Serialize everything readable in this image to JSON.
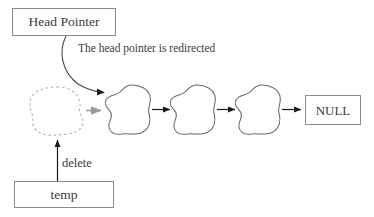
{
  "diagram": {
    "canvas": {
      "width": 374,
      "height": 217,
      "background": "#ffffff"
    },
    "colors": {
      "stroke": "#5a5a5a",
      "box_border": "#8a8a8a",
      "text": "#3a3a3a",
      "dashed_node": "#b0b0b0",
      "gray_arrow": "#9a9a9a",
      "black_arrow": "#1a1a1a"
    },
    "boxes": [
      {
        "id": "head-pointer",
        "label": "Head Pointer",
        "x": 12,
        "y": 8,
        "width": 104,
        "height": 28
      },
      {
        "id": "null",
        "label": "NULL",
        "x": 305,
        "y": 95,
        "width": 56,
        "height": 30
      },
      {
        "id": "temp",
        "label": "temp",
        "x": 14,
        "y": 181,
        "width": 100,
        "height": 27
      }
    ],
    "annotations": [
      {
        "id": "redirect-note",
        "label": "The head pointer is redirected",
        "x": 78,
        "y": 43
      },
      {
        "id": "delete-label",
        "label": "delete",
        "x": 62,
        "y": 157
      }
    ],
    "nodes": [
      {
        "id": "node-deleted",
        "style": "dashed",
        "cx": 57,
        "cy": 111,
        "label": ""
      },
      {
        "id": "node-1",
        "style": "solid",
        "cx": 129,
        "cy": 110,
        "label": ""
      },
      {
        "id": "node-2",
        "style": "solid",
        "cx": 194,
        "cy": 110,
        "label": ""
      },
      {
        "id": "node-3",
        "style": "solid",
        "cx": 259,
        "cy": 110,
        "label": ""
      }
    ],
    "arrows": [
      {
        "id": "arrow-head-redirect",
        "from": "head-pointer",
        "to": "node-1",
        "style": "curved",
        "color": "#4a4a4a"
      },
      {
        "id": "arrow-deleted-to-node1",
        "from": "node-deleted",
        "to": "node-1",
        "style": "straight",
        "color": "#9a9a9a"
      },
      {
        "id": "arrow-node1-to-node2",
        "from": "node-1",
        "to": "node-2",
        "style": "straight",
        "color": "#1a1a1a"
      },
      {
        "id": "arrow-node2-to-node3",
        "from": "node-2",
        "to": "node-3",
        "style": "straight",
        "color": "#1a1a1a"
      },
      {
        "id": "arrow-node3-to-null",
        "from": "node-3",
        "to": "null",
        "style": "straight",
        "color": "#1a1a1a"
      },
      {
        "id": "arrow-temp-to-deleted",
        "from": "temp",
        "to": "node-deleted",
        "style": "straight-vertical",
        "color": "#1a1a1a"
      }
    ]
  }
}
